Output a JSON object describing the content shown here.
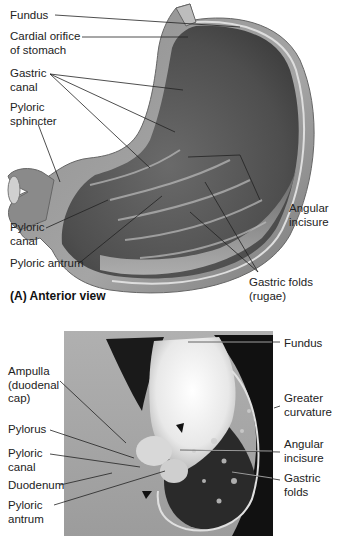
{
  "panel_a": {
    "caption": "(A)  Anterior view",
    "labels": {
      "fundus": "Fundus",
      "cardial_orifice": "Cardial orifice\nof stomach",
      "gastric_canal": "Gastric\ncanal",
      "pyloric_sphincter": "Pyloric\nsphincter",
      "angular_incisure": "Angular\nincisure",
      "pyloric_canal": "Pyloric\ncanal",
      "pyloric_antrum": "Pyloric antrum",
      "gastric_folds": "Gastric folds\n(rugae)"
    }
  },
  "panel_b": {
    "labels": {
      "fundus": "Fundus",
      "ampulla": "Ampulla\n(duodenal\ncap)",
      "greater_curvature": "Greater\ncurvature",
      "pylorus": "Pylorus",
      "angular_incisure": "Angular\nincisure",
      "pyloric_canal": "Pyloric\ncanal",
      "gastric_folds": "Gastric\nfolds",
      "duodenum": "Duodenum",
      "pyloric_antrum": "Pyloric\nantrum"
    }
  },
  "colors": {
    "stomach_outer": "#9a9a9a",
    "stomach_inner": "#5a5a5a",
    "wall_highlight": "#d8d8d8",
    "leader_line": "#222222",
    "xray_bg": "#8a8a8a"
  }
}
